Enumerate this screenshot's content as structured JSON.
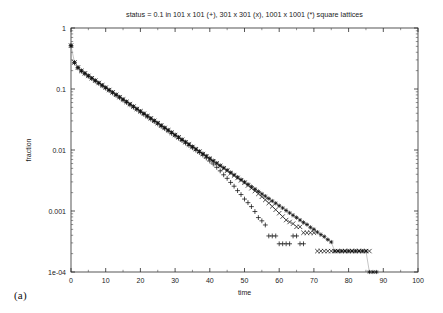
{
  "figure": {
    "panel_label": "(a)",
    "background": "#ffffff"
  },
  "chart_data": {
    "type": "scatter",
    "title": "status = 0.1 in 101 x 101 (+), 301 x 301 (x), 1001 x 1001 (*) square lattices",
    "xlabel": "time",
    "ylabel": "fraction",
    "xlim": [
      0,
      100
    ],
    "ylim": [
      0.0001,
      1
    ],
    "yscale": "log",
    "xscale": "linear",
    "grid": false,
    "legend_position": "in-title",
    "xticks": [
      0,
      10,
      20,
      30,
      40,
      50,
      60,
      70,
      80,
      90,
      100
    ],
    "xtick_labels": [
      "0",
      "10",
      "20",
      "30",
      "40",
      "50",
      "60",
      "70",
      "80",
      "90",
      "100"
    ],
    "yticks": [
      1,
      0.1,
      0.01,
      0.001,
      0.0001
    ],
    "ytick_labels": [
      "1",
      "0.1",
      "0.01",
      "0.001",
      "1e-04"
    ],
    "marker_colors": {
      "series_1": "#111111",
      "series_2": "#111111",
      "series_3": "#111111"
    },
    "series": [
      {
        "name": "101 x 101",
        "marker": "plus",
        "lattice": "101 x 101",
        "x": [
          0,
          1,
          2,
          3,
          4,
          5,
          6,
          7,
          8,
          9,
          10,
          11,
          12,
          13,
          14,
          15,
          16,
          17,
          18,
          19,
          20,
          21,
          22,
          23,
          24,
          25,
          26,
          27,
          28,
          29,
          30,
          31,
          32,
          33,
          34,
          35,
          36,
          37,
          38,
          39,
          40,
          41,
          42,
          43,
          44,
          45,
          46,
          47,
          48,
          49,
          50,
          51,
          52,
          53,
          54,
          55,
          56,
          57,
          58,
          59,
          60,
          61,
          62,
          63,
          64,
          65,
          66,
          67
        ],
        "y": [
          0.512,
          0.268,
          0.222,
          0.196,
          0.178,
          0.162,
          0.148,
          0.135,
          0.1235,
          0.1129,
          0.1032,
          0.0943,
          0.0862,
          0.0788,
          0.072,
          0.0658,
          0.0602,
          0.055,
          0.0503,
          0.0459,
          0.042,
          0.0384,
          0.0351,
          0.0321,
          0.0293,
          0.0268,
          0.0245,
          0.0224,
          0.0205,
          0.0187,
          0.0171,
          0.0156,
          0.0143,
          0.013,
          0.0119,
          0.0109,
          0.00995,
          0.0091,
          0.00825,
          0.0074,
          0.0066,
          0.0059,
          0.0052,
          0.00455,
          0.00392,
          0.00343,
          0.00294,
          0.00255,
          0.00216,
          0.00186,
          0.00157,
          0.00137,
          0.00118,
          0.00098,
          0.00078,
          0.00069,
          0.00059,
          0.00039,
          0.00039,
          0.00039,
          0.00029,
          0.00029,
          0.00029,
          0.00029,
          0.00039,
          0.00039,
          0.00029,
          0.00029
        ]
      },
      {
        "name": "301 x 301",
        "marker": "cross",
        "lattice": "301 x 301",
        "x": [
          0,
          1,
          2,
          3,
          4,
          5,
          6,
          7,
          8,
          9,
          10,
          11,
          12,
          13,
          14,
          15,
          16,
          17,
          18,
          19,
          20,
          21,
          22,
          23,
          24,
          25,
          26,
          27,
          28,
          29,
          30,
          31,
          32,
          33,
          34,
          35,
          36,
          37,
          38,
          39,
          40,
          41,
          42,
          43,
          44,
          45,
          46,
          47,
          48,
          49,
          50,
          51,
          52,
          53,
          54,
          55,
          56,
          57,
          58,
          59,
          60,
          61,
          62,
          63,
          64,
          65,
          66,
          67,
          68,
          69,
          70,
          71,
          72,
          73,
          74,
          75,
          76,
          77,
          78,
          79,
          80,
          81,
          82,
          83,
          84,
          85,
          86
        ],
        "y": [
          0.513,
          0.272,
          0.224,
          0.198,
          0.18,
          0.164,
          0.15,
          0.1372,
          0.1256,
          0.115,
          0.1052,
          0.0962,
          0.0879,
          0.0804,
          0.0735,
          0.0672,
          0.0614,
          0.0562,
          0.0514,
          0.047,
          0.043,
          0.0393,
          0.0359,
          0.0329,
          0.0301,
          0.0275,
          0.0251,
          0.023,
          0.021,
          0.0192,
          0.0176,
          0.0161,
          0.0147,
          0.0134,
          0.0123,
          0.0112,
          0.0103,
          0.00938,
          0.00858,
          0.00784,
          0.00717,
          0.00655,
          0.00599,
          0.00547,
          0.005,
          0.00457,
          0.00417,
          0.00381,
          0.00348,
          0.00318,
          0.0029,
          0.00262,
          0.00236,
          0.00213,
          0.00191,
          0.00171,
          0.00152,
          0.00135,
          0.00119,
          0.00105,
          0.00092,
          0.00081,
          0.00071,
          0.00066,
          0.00062,
          0.00055,
          0.00055,
          0.00044,
          0.00044,
          0.00044,
          0.00044,
          0.00022,
          0.00022,
          0.00022,
          0.00022,
          0.00022,
          0.00022,
          0.00022,
          0.00022,
          0.00022,
          0.00022,
          0.00022,
          0.00022,
          0.00022,
          0.00022,
          0.00022,
          0.00022
        ]
      },
      {
        "name": "1001 x 1001",
        "marker": "star",
        "lattice": "1001 x 1001",
        "x": [
          0,
          1,
          2,
          3,
          4,
          5,
          6,
          7,
          8,
          9,
          10,
          11,
          12,
          13,
          14,
          15,
          16,
          17,
          18,
          19,
          20,
          21,
          22,
          23,
          24,
          25,
          26,
          27,
          28,
          29,
          30,
          31,
          32,
          33,
          34,
          35,
          36,
          37,
          38,
          39,
          40,
          41,
          42,
          43,
          44,
          45,
          46,
          47,
          48,
          49,
          50,
          51,
          52,
          53,
          54,
          55,
          56,
          57,
          58,
          59,
          60,
          61,
          62,
          63,
          64,
          65,
          66,
          67,
          68,
          69,
          70,
          71,
          72,
          73,
          74,
          75,
          76,
          77,
          78,
          79,
          80,
          81,
          82,
          83,
          84,
          85,
          86,
          87,
          88
        ],
        "y": [
          0.514,
          0.274,
          0.2255,
          0.1995,
          0.1812,
          0.1652,
          0.1508,
          0.1379,
          0.1262,
          0.1155,
          0.1057,
          0.0967,
          0.0885,
          0.081,
          0.0741,
          0.0678,
          0.062,
          0.0567,
          0.0519,
          0.0475,
          0.0434,
          0.0397,
          0.0363,
          0.0332,
          0.0304,
          0.0278,
          0.0254,
          0.0233,
          0.0213,
          0.0195,
          0.0178,
          0.0163,
          0.0149,
          0.0136,
          0.0125,
          0.0114,
          0.0104,
          0.00955,
          0.00873,
          0.00799,
          0.00731,
          0.00668,
          0.00611,
          0.00559,
          0.00511,
          0.00468,
          0.00428,
          0.00391,
          0.00358,
          0.00327,
          0.00299,
          0.00274,
          0.0025,
          0.00229,
          0.00209,
          0.00191,
          0.00175,
          0.0016,
          0.00146,
          0.00134,
          0.00122,
          0.00112,
          0.00102,
          0.00093,
          0.00085,
          0.00078,
          0.00071,
          0.00065,
          0.0006,
          0.00054,
          0.0005,
          0.00045,
          0.00041,
          0.00038,
          0.00034,
          0.00031,
          0.00022,
          0.00022,
          0.00022,
          0.00022,
          0.00022,
          0.00022,
          0.00022,
          0.00022,
          0.00022,
          0.00022,
          0.0001,
          0.0001,
          0.0001
        ]
      }
    ],
    "tail_plateaus": [
      {
        "series": "101 x 101",
        "level": 0.00029,
        "x_start": 60,
        "x_end": 67
      },
      {
        "series": "301 x 301",
        "level": 0.00022,
        "x_start": 71,
        "x_end": 86
      },
      {
        "series": "1001 x 1001",
        "level": 0.0001,
        "x_start": 76,
        "x_end": 88
      }
    ]
  }
}
